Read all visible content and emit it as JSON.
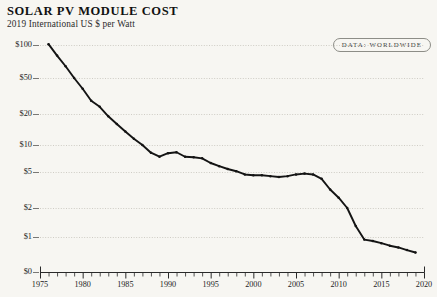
{
  "header": {
    "title": "SOLAR PV MODULE COST",
    "subtitle": "2019 International US $ per Watt"
  },
  "badge": {
    "label": "DATA: WORLDWIDE"
  },
  "chart_data": {
    "type": "line",
    "title": "SOLAR PV MODULE COST",
    "subtitle": "2019 International US $ per Watt",
    "xlabel": "",
    "ylabel": "2019 International US $ per Watt",
    "yscale": "log",
    "xlim": [
      1975,
      2020
    ],
    "ylim": [
      0,
      100
    ],
    "grid": true,
    "legend_position": "top-right",
    "y_ticks": [
      {
        "label": "$100",
        "value": 100
      },
      {
        "label": "$50",
        "value": 50
      },
      {
        "label": "$20",
        "value": 20
      },
      {
        "label": "$10",
        "value": 10
      },
      {
        "label": "$5",
        "value": 5
      },
      {
        "label": "$2",
        "value": 2
      },
      {
        "label": "$1",
        "value": 1
      },
      {
        "label": "$0",
        "value": 0
      }
    ],
    "x_ticks": [
      "1975",
      "1980",
      "1985",
      "1990",
      "1995",
      "2000",
      "2005",
      "2010",
      "2015",
      "2020"
    ],
    "x_minor_tick_interval": 1,
    "series": [
      {
        "name": "Solar PV module cost",
        "color": "#141414",
        "x": [
          1976,
          1977,
          1978,
          1979,
          1980,
          1981,
          1982,
          1983,
          1984,
          1985,
          1986,
          1987,
          1988,
          1989,
          1990,
          1991,
          1992,
          1993,
          1994,
          1995,
          1996,
          1997,
          1998,
          1999,
          2000,
          2001,
          2002,
          2003,
          2004,
          2005,
          2006,
          2007,
          2008,
          2009,
          2010,
          2011,
          2012,
          2013,
          2014,
          2015,
          2016,
          2017,
          2018,
          2019
        ],
        "values": [
          106.0,
          80.0,
          64.0,
          50.0,
          38.0,
          28.0,
          24.0,
          19.0,
          16.0,
          13.5,
          11.5,
          10.0,
          8.2,
          7.4,
          8.1,
          8.3,
          7.4,
          7.3,
          7.1,
          6.3,
          5.8,
          5.4,
          5.1,
          4.7,
          4.6,
          4.6,
          4.5,
          4.4,
          4.5,
          4.7,
          4.8,
          4.7,
          4.2,
          3.2,
          2.6,
          2.0,
          1.3,
          0.85,
          0.78,
          0.68,
          0.58,
          0.52,
          0.44,
          0.38
        ]
      }
    ]
  }
}
